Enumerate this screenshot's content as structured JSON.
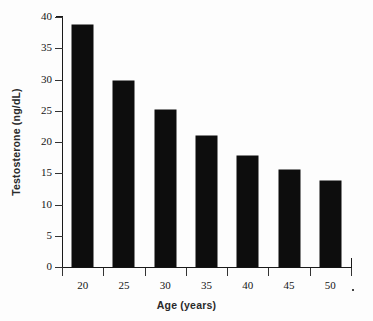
{
  "chart_data": {
    "type": "bar",
    "title": "",
    "xlabel": "Age (years)",
    "ylabel": "Testosterone (ng/dL)",
    "categories": [
      "20",
      "25",
      "30",
      "35",
      "40",
      "45",
      "50"
    ],
    "values": [
      38.7,
      29.8,
      25.2,
      21.0,
      17.7,
      15.6,
      13.8
    ],
    "series": [
      {
        "name": "Testosterone",
        "values": [
          38.7,
          29.8,
          25.2,
          21.0,
          17.7,
          15.6,
          13.8
        ]
      }
    ],
    "ylim": [
      0,
      40
    ],
    "xlim_labels": [
      "20",
      "50"
    ],
    "y_ticks": [
      "0",
      "5",
      "10",
      "15",
      "20",
      "25",
      "30",
      "35",
      "40"
    ],
    "y_tick_values": [
      0,
      5,
      10,
      15,
      20,
      25,
      30,
      35,
      40
    ],
    "x_ticks": [
      "20",
      "25",
      "30",
      "35",
      "40",
      "45",
      "50"
    ],
    "grid": false,
    "legend": false,
    "legend_position": "none",
    "bar_color": "#0d0d0d",
    "background_color": "#fdfdfd",
    "axis_color": "#1a1a1a",
    "annotations": []
  }
}
